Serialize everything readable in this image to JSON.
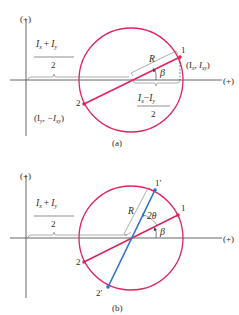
{
  "figure_a": {
    "caption": "(a)",
    "axis_y_label": "(+)",
    "axis_x_label": "(+)",
    "center_numerator": "I",
    "center_num_sub_x": "x",
    "center_num_plus": "+",
    "center_num_sub_y": "y",
    "center_denominator": "2",
    "radius_label": "R",
    "angle_label": "β",
    "point1_label": "1",
    "point1_coords": "(I",
    "point1_coords_sub1": "x",
    "point1_coords_mid": ", I",
    "point1_coords_sub2": "xy",
    "point1_coords_end": ")",
    "point2_label": "2",
    "point2_coords": "(I",
    "point2_coords_sub1": "y",
    "point2_coords_mid": ", −I",
    "point2_coords_sub2": "xy",
    "point2_coords_end": ")",
    "half_diff_minus": "−",
    "half_diff_denominator": "2"
  },
  "figure_b": {
    "caption": "(b)",
    "axis_y_label": "(+)",
    "axis_x_label": "(+)",
    "center_denominator": "2",
    "radius_label": "R",
    "angle_2theta_label": "2θ",
    "angle_beta_label": "β",
    "point1_label": "1",
    "point2_label": "2",
    "point1p_label": "1′",
    "point2p_label": "2′"
  },
  "colors": {
    "circle": "#e0245e",
    "diameter_original": "#e0245e",
    "diameter_rotated": "#2a6fd6",
    "axes": "#555555",
    "text": "#2a2a2a"
  }
}
